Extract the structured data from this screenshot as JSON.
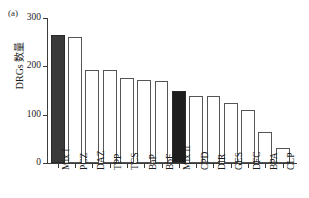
{
  "panel": {
    "label": "(a)"
  },
  "chart_data": {
    "type": "bar",
    "title": "",
    "subtitle": "",
    "xlabel": "",
    "ylabel": "DRGs 数量",
    "ylim": [
      0,
      300
    ],
    "yticks": [
      0,
      100,
      200,
      300
    ],
    "ytick_labels": [
      "0",
      "100",
      "200",
      "300"
    ],
    "grid": false,
    "legend": "none",
    "categories": [
      "Mix I",
      "PCZ",
      "DAZ",
      "TPP",
      "TCS",
      "BaP",
      "BbF",
      "Mix II",
      "CPD",
      "DIR",
      "GES",
      "DFC",
      "BPA",
      "CLP"
    ],
    "values": [
      265,
      260,
      193,
      192,
      176,
      172,
      169,
      150,
      138,
      138,
      124,
      110,
      65,
      32
    ],
    "bar_styles": [
      "dark-gray",
      "open",
      "open",
      "open",
      "open",
      "open",
      "open",
      "black",
      "open",
      "open",
      "open",
      "open",
      "open",
      "open"
    ],
    "colors": {
      "dark_gray_fill": "#3a3a3a",
      "black_fill": "#1e1e1e",
      "open_fill": "#ffffff",
      "bar_edge": "#555555",
      "axis": "#3c3c3c",
      "text": "#1c1c1c"
    }
  }
}
